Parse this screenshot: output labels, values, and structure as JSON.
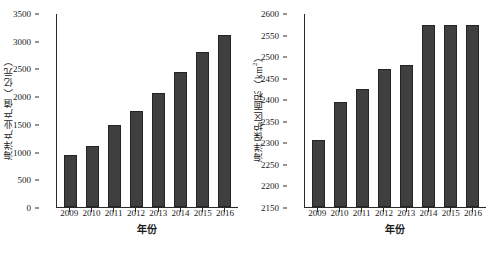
{
  "chart_data": [
    {
      "type": "bar",
      "panel": "left",
      "title": "",
      "xlabel": "年份",
      "ylabel": "海洋产业产值（亿元）",
      "ylabel_main": "海洋产业产值（亿元）",
      "categories": [
        "2009",
        "2010",
        "2011",
        "2012",
        "2013",
        "2014",
        "2015",
        "2016"
      ],
      "values": [
        940,
        1100,
        1485,
        1730,
        2060,
        2440,
        2800,
        3100
      ],
      "ylim": [
        0,
        3500
      ],
      "ytick_step": 500,
      "yticks": [
        "0",
        "500",
        "1000",
        "1500",
        "2000",
        "2500",
        "3000",
        "3500"
      ],
      "ytick_values": [
        0,
        500,
        1000,
        1500,
        2000,
        2500,
        3000,
        3500
      ],
      "grid": false,
      "legend": "none",
      "bar_color": "#3f3f3f"
    },
    {
      "type": "bar",
      "panel": "right",
      "title": "",
      "xlabel": "年份",
      "ylabel": "海洋保护区面积（km²）",
      "ylabel_prefix": "海洋保护区面积（km",
      "ylabel_sup": "2",
      "ylabel_suffix": "）",
      "categories": [
        "2009",
        "2010",
        "2011",
        "2012",
        "2013",
        "2014",
        "2015",
        "2016"
      ],
      "values": [
        2306,
        2393,
        2423,
        2469,
        2479,
        2572,
        2572,
        2572
      ],
      "ylim": [
        2150,
        2600
      ],
      "ytick_step": 50,
      "yticks": [
        "2150",
        "2200",
        "2250",
        "2300",
        "2350",
        "2400",
        "2450",
        "2500",
        "2550",
        "2600"
      ],
      "ytick_values": [
        2150,
        2200,
        2250,
        2300,
        2350,
        2400,
        2450,
        2500,
        2550,
        2600
      ],
      "grid": false,
      "legend": "none",
      "bar_color": "#3f3f3f"
    }
  ]
}
